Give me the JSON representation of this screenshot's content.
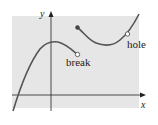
{
  "figure": {
    "background_color": "#ffffff",
    "panel_color": "#e6e6e6",
    "curve_color": "#555555",
    "axis_color": "#222222",
    "axes": {
      "x_label": "x",
      "y_label": "y"
    },
    "annotations": {
      "break_label": "break",
      "hole_label": "hole"
    },
    "points": {
      "break_open_circle": "open",
      "jump_filled_dot": "filled",
      "hole_open_circle": "open"
    }
  }
}
